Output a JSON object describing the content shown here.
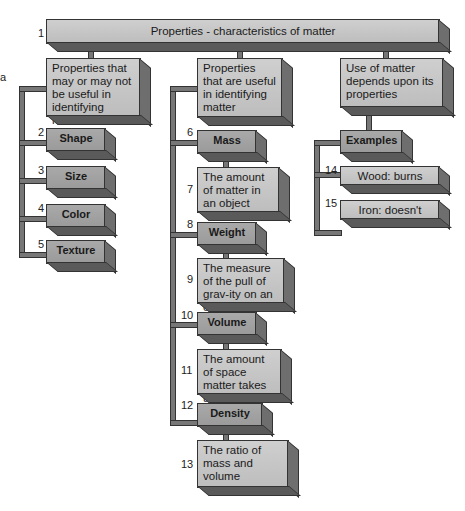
{
  "root": {
    "number": "1",
    "label": "Properties - characteristics of matter"
  },
  "side_mark": "a",
  "branches": [
    {
      "label": "Properties that may or may not be useful in identifying matter",
      "items": [
        {
          "number": "2",
          "label": "Shape"
        },
        {
          "number": "3",
          "label": "Size"
        },
        {
          "number": "4",
          "label": "Color"
        },
        {
          "number": "5",
          "label": "Texture"
        }
      ]
    },
    {
      "label": "Properties that are useful in identifying matter",
      "items": [
        {
          "number": "6",
          "label": "Mass",
          "desc_number": "7",
          "desc": "The amount of matter in an object"
        },
        {
          "number": "8",
          "label": "Weight",
          "desc_number": "9",
          "desc": "The measure of the pull of grav-ity on an object"
        },
        {
          "number": "10",
          "label": "Volume",
          "desc_number": "11",
          "desc": "The amount of space matter takes up"
        },
        {
          "number": "12",
          "label": "Density",
          "desc_number": "13",
          "desc": "The ratio of mass and volume"
        }
      ]
    },
    {
      "label": "Use of matter depends upon its properties",
      "sub": {
        "label": "Examples"
      },
      "items": [
        {
          "number": "14",
          "label": "Wood: burns"
        },
        {
          "number": "15",
          "label": "Iron: doesn't burn"
        }
      ]
    }
  ]
}
